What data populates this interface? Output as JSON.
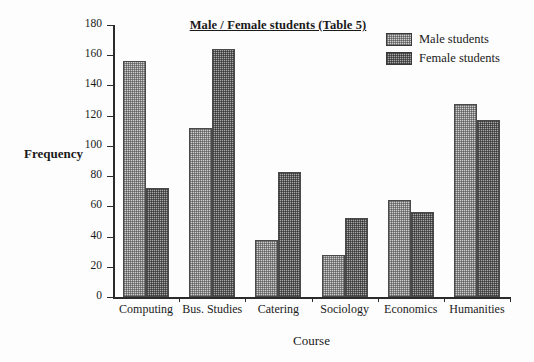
{
  "chart_data": {
    "type": "bar",
    "title": "Male / Female students (Table 5)",
    "xlabel": "Course",
    "ylabel": "Frequency",
    "categories": [
      "Computing",
      "Bus. Studies",
      "Catering",
      "Sociology",
      "Economics",
      "Humanities"
    ],
    "series": [
      {
        "name": "Male students",
        "values": [
          156,
          112,
          38,
          28,
          64,
          128
        ],
        "color": "#cfcfcf"
      },
      {
        "name": "Female students",
        "values": [
          72,
          164,
          83,
          52,
          56,
          117
        ],
        "color": "#a8a8a8"
      }
    ],
    "ylim": [
      0,
      180
    ],
    "ytick_labels": [
      "0",
      "20",
      "40",
      "60",
      "80",
      "100",
      "120",
      "140",
      "160",
      "180"
    ],
    "ytick_values": [
      0,
      20,
      40,
      60,
      80,
      100,
      120,
      140,
      160,
      180
    ],
    "grid": false,
    "legend_position": "top-right"
  },
  "legend": {
    "entries": [
      {
        "label": "Male students"
      },
      {
        "label": "Female students"
      }
    ]
  }
}
